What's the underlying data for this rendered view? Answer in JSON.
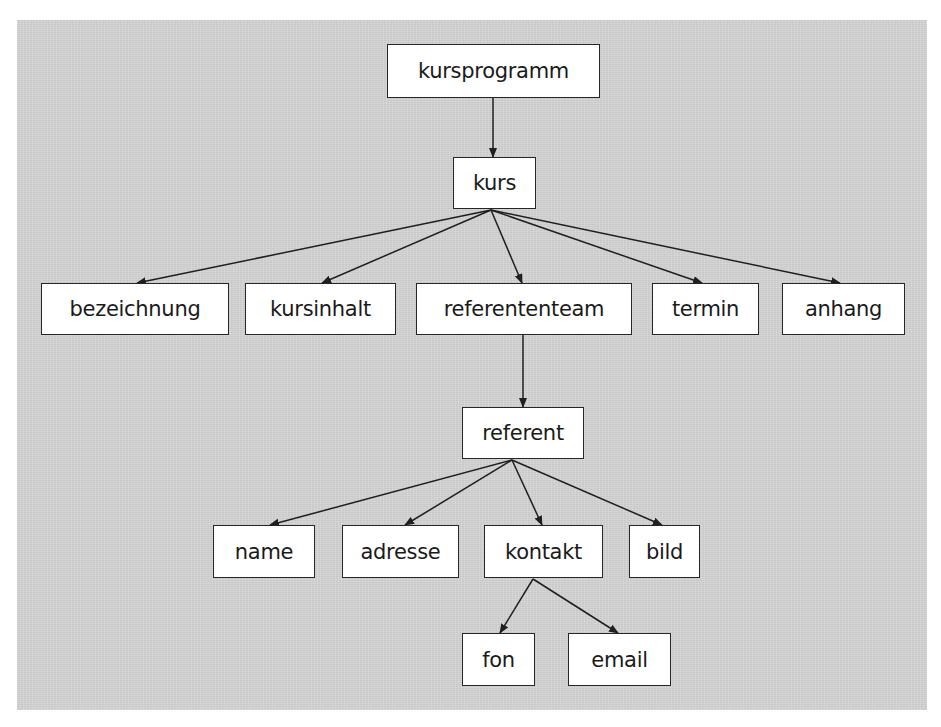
{
  "diagram": {
    "type": "tree",
    "background_color": "#d5d5d5",
    "nodes": [
      {
        "id": "kursprogramm",
        "label": "kursprogramm",
        "x": 387,
        "y": 44,
        "w": 213,
        "h": 54
      },
      {
        "id": "kurs",
        "label": "kurs",
        "x": 453,
        "y": 157,
        "w": 83,
        "h": 52
      },
      {
        "id": "bezeichnung",
        "label": "bezeichnung",
        "x": 41,
        "y": 283,
        "w": 188,
        "h": 52
      },
      {
        "id": "kursinhalt",
        "label": "kursinhalt",
        "x": 245,
        "y": 283,
        "w": 151,
        "h": 52
      },
      {
        "id": "referententeam",
        "label": "referententeam",
        "x": 416,
        "y": 283,
        "w": 216,
        "h": 52
      },
      {
        "id": "termin",
        "label": "termin",
        "x": 652,
        "y": 283,
        "w": 107,
        "h": 52
      },
      {
        "id": "anhang",
        "label": "anhang",
        "x": 782,
        "y": 283,
        "w": 123,
        "h": 52
      },
      {
        "id": "referent",
        "label": "referent",
        "x": 462,
        "y": 407,
        "w": 122,
        "h": 52
      },
      {
        "id": "name",
        "label": "name",
        "x": 213,
        "y": 525,
        "w": 102,
        "h": 53
      },
      {
        "id": "adresse",
        "label": "adresse",
        "x": 342,
        "y": 525,
        "w": 117,
        "h": 53
      },
      {
        "id": "kontakt",
        "label": "kontakt",
        "x": 484,
        "y": 525,
        "w": 119,
        "h": 53
      },
      {
        "id": "bild",
        "label": "bild",
        "x": 629,
        "y": 525,
        "w": 71,
        "h": 53
      },
      {
        "id": "fon",
        "label": "fon",
        "x": 462,
        "y": 633,
        "w": 73,
        "h": 53
      },
      {
        "id": "email",
        "label": "email",
        "x": 568,
        "y": 633,
        "w": 103,
        "h": 53
      }
    ],
    "edges": [
      {
        "from": "kursprogramm",
        "to": "kurs",
        "x1": 493,
        "y1": 98,
        "x2": 493,
        "y2": 157
      },
      {
        "from": "kurs",
        "to": "bezeichnung",
        "x1": 491,
        "y1": 210,
        "x2": 137,
        "y2": 283
      },
      {
        "from": "kurs",
        "to": "kursinhalt",
        "x1": 491,
        "y1": 210,
        "x2": 322,
        "y2": 283
      },
      {
        "from": "kurs",
        "to": "referententeam",
        "x1": 491,
        "y1": 210,
        "x2": 522,
        "y2": 283
      },
      {
        "from": "kurs",
        "to": "termin",
        "x1": 491,
        "y1": 210,
        "x2": 702,
        "y2": 283
      },
      {
        "from": "kurs",
        "to": "anhang",
        "x1": 491,
        "y1": 210,
        "x2": 840,
        "y2": 283
      },
      {
        "from": "referententeam",
        "to": "referent",
        "x1": 523,
        "y1": 335,
        "x2": 523,
        "y2": 407
      },
      {
        "from": "referent",
        "to": "name",
        "x1": 512,
        "y1": 460,
        "x2": 270,
        "y2": 525
      },
      {
        "from": "referent",
        "to": "adresse",
        "x1": 512,
        "y1": 460,
        "x2": 405,
        "y2": 525
      },
      {
        "from": "referent",
        "to": "kontakt",
        "x1": 512,
        "y1": 460,
        "x2": 542,
        "y2": 525
      },
      {
        "from": "referent",
        "to": "bild",
        "x1": 512,
        "y1": 460,
        "x2": 662,
        "y2": 525
      },
      {
        "from": "kontakt",
        "to": "fon",
        "x1": 533,
        "y1": 579,
        "x2": 500,
        "y2": 633
      },
      {
        "from": "kontakt",
        "to": "email",
        "x1": 533,
        "y1": 579,
        "x2": 618,
        "y2": 633
      }
    ]
  }
}
